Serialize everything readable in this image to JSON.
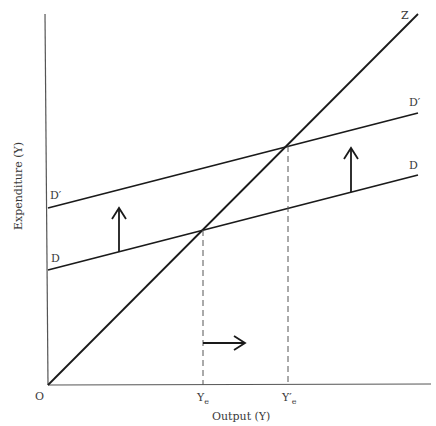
{
  "diagram": {
    "type": "keynesian-cross",
    "colors": {
      "line": "#1a1a1a",
      "axis": "#555555",
      "text": "#3a3a3a",
      "dash": "#555555",
      "background": "#ffffff"
    },
    "axes": {
      "x_label": "Output (Y)",
      "y_label": "Expenditure (Y)",
      "origin_label": "O"
    },
    "lines": {
      "z": {
        "label": "Z"
      },
      "d": {
        "label_left": "D",
        "label_right": "D"
      },
      "d_prime": {
        "label_left": "D′",
        "label_right": "D′"
      }
    },
    "equilibria": [
      {
        "label_main": "Y",
        "label_sub": "e",
        "prime": ""
      },
      {
        "label_main": "Y",
        "label_sub": "e",
        "prime": "′"
      }
    ],
    "arrows": {
      "shift_up_left": "up",
      "shift_up_right": "up",
      "output_increase": "right"
    }
  }
}
